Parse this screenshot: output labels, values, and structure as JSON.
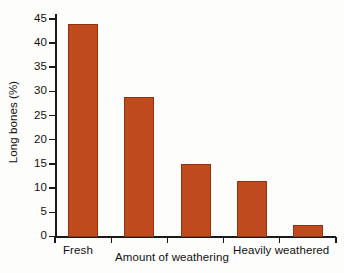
{
  "chart_data": {
    "type": "bar",
    "title": "",
    "subtitle": "",
    "xlabel": "Amount of weathering",
    "ylabel": "Long bones (%)",
    "categories": [
      "1",
      "2",
      "3",
      "4",
      "5"
    ],
    "category_end_labels": {
      "left": "Fresh",
      "right": "Heavily weathered"
    },
    "values": [
      44,
      29,
      15,
      11.5,
      2.5
    ],
    "ylim": [
      0,
      46
    ],
    "yticks": [
      0,
      5,
      10,
      15,
      20,
      25,
      30,
      35,
      40,
      45
    ],
    "ytick_labels": [
      "0",
      "5",
      "10",
      "15",
      "20",
      "25",
      "30",
      "35",
      "40",
      "45"
    ],
    "xticks_visible": true,
    "xtick_labels": [],
    "grid": false,
    "legend": null,
    "legend_position": "none",
    "bar_color": "#bf4a1e",
    "bar_edge_color": "#8f3311",
    "axis_color": "#1a1a1a",
    "background_color": "#fdfdfc"
  }
}
